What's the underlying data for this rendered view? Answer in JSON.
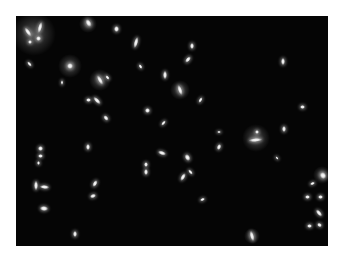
{
  "image": {
    "description": "Fluorescence micrograph of rod-shaped bacteria on a dark background",
    "frame": {
      "x": 16,
      "y": 16,
      "width": 312,
      "height": 230
    },
    "background_color": "#050505",
    "cell_color": "#ffffff",
    "glows": [
      {
        "x": 34,
        "y": 34,
        "r": 22
      },
      {
        "x": 70,
        "y": 66,
        "r": 12
      },
      {
        "x": 88,
        "y": 24,
        "r": 9
      },
      {
        "x": 100,
        "y": 80,
        "r": 11
      },
      {
        "x": 180,
        "y": 90,
        "r": 10
      },
      {
        "x": 256,
        "y": 138,
        "r": 14
      },
      {
        "x": 322,
        "y": 175,
        "r": 9
      },
      {
        "x": 252,
        "y": 236,
        "r": 8
      }
    ],
    "cells": [
      {
        "x": 28,
        "y": 32,
        "w": 3,
        "h": 9,
        "rot": -35
      },
      {
        "x": 40,
        "y": 27,
        "w": 3,
        "h": 10,
        "rot": 15
      },
      {
        "x": 38,
        "y": 38,
        "w": 4,
        "h": 4,
        "rot": 0
      },
      {
        "x": 30,
        "y": 42,
        "w": 3,
        "h": 3,
        "rot": 0
      },
      {
        "x": 88,
        "y": 23,
        "w": 4,
        "h": 7,
        "rot": -30
      },
      {
        "x": 116,
        "y": 29,
        "w": 4,
        "h": 5,
        "rot": 0
      },
      {
        "x": 136,
        "y": 42,
        "w": 3,
        "h": 10,
        "rot": 15
      },
      {
        "x": 29,
        "y": 64,
        "w": 2,
        "h": 5,
        "rot": -40
      },
      {
        "x": 70,
        "y": 66,
        "w": 5,
        "h": 5,
        "rot": 0
      },
      {
        "x": 62,
        "y": 82,
        "w": 1,
        "h": 4,
        "rot": 0
      },
      {
        "x": 100,
        "y": 80,
        "w": 3,
        "h": 9,
        "rot": -30
      },
      {
        "x": 107,
        "y": 77,
        "w": 2,
        "h": 4,
        "rot": -40
      },
      {
        "x": 88,
        "y": 100,
        "w": 4,
        "h": 3,
        "rot": 0
      },
      {
        "x": 97,
        "y": 100,
        "w": 3,
        "h": 8,
        "rot": -45
      },
      {
        "x": 140,
        "y": 66,
        "w": 2,
        "h": 4,
        "rot": -30
      },
      {
        "x": 165,
        "y": 75,
        "w": 3,
        "h": 7,
        "rot": 0
      },
      {
        "x": 192,
        "y": 46,
        "w": 3,
        "h": 5,
        "rot": 0
      },
      {
        "x": 188,
        "y": 59,
        "w": 3,
        "h": 6,
        "rot": 40
      },
      {
        "x": 180,
        "y": 90,
        "w": 3,
        "h": 9,
        "rot": -20
      },
      {
        "x": 200,
        "y": 100,
        "w": 2,
        "h": 5,
        "rot": 30
      },
      {
        "x": 147,
        "y": 110,
        "w": 4,
        "h": 4,
        "rot": 0
      },
      {
        "x": 106,
        "y": 118,
        "w": 3,
        "h": 5,
        "rot": -40
      },
      {
        "x": 163,
        "y": 123,
        "w": 2,
        "h": 5,
        "rot": 40
      },
      {
        "x": 283,
        "y": 61,
        "w": 3,
        "h": 6,
        "rot": 0
      },
      {
        "x": 302,
        "y": 107,
        "w": 4,
        "h": 3,
        "rot": 0
      },
      {
        "x": 284,
        "y": 129,
        "w": 3,
        "h": 5,
        "rot": 0
      },
      {
        "x": 219,
        "y": 132,
        "w": 3,
        "h": 1,
        "rot": 0
      },
      {
        "x": 257,
        "y": 132,
        "w": 3,
        "h": 3,
        "rot": 0
      },
      {
        "x": 255,
        "y": 140,
        "w": 12,
        "h": 3,
        "rot": -5
      },
      {
        "x": 219,
        "y": 147,
        "w": 3,
        "h": 5,
        "rot": 20
      },
      {
        "x": 277,
        "y": 158,
        "w": 1,
        "h": 3,
        "rot": -40
      },
      {
        "x": 40,
        "y": 148,
        "w": 4,
        "h": 4,
        "rot": 0
      },
      {
        "x": 40,
        "y": 156,
        "w": 4,
        "h": 3,
        "rot": 0
      },
      {
        "x": 38,
        "y": 163,
        "w": 2,
        "h": 3,
        "rot": 0
      },
      {
        "x": 88,
        "y": 147,
        "w": 3,
        "h": 5,
        "rot": 0
      },
      {
        "x": 162,
        "y": 153,
        "w": 7,
        "h": 3,
        "rot": 20
      },
      {
        "x": 187,
        "y": 157,
        "w": 4,
        "h": 6,
        "rot": -30
      },
      {
        "x": 146,
        "y": 164,
        "w": 3,
        "h": 4,
        "rot": 0
      },
      {
        "x": 146,
        "y": 172,
        "w": 3,
        "h": 5,
        "rot": 0
      },
      {
        "x": 183,
        "y": 177,
        "w": 3,
        "h": 7,
        "rot": 30
      },
      {
        "x": 190,
        "y": 172,
        "w": 2,
        "h": 5,
        "rot": -40
      },
      {
        "x": 36,
        "y": 185,
        "w": 3,
        "h": 8,
        "rot": 0
      },
      {
        "x": 44,
        "y": 187,
        "w": 8,
        "h": 3,
        "rot": 5
      },
      {
        "x": 95,
        "y": 183,
        "w": 3,
        "h": 6,
        "rot": 30
      },
      {
        "x": 93,
        "y": 196,
        "w": 5,
        "h": 3,
        "rot": -20
      },
      {
        "x": 44,
        "y": 208,
        "w": 7,
        "h": 4,
        "rot": 5
      },
      {
        "x": 202,
        "y": 199,
        "w": 4,
        "h": 2,
        "rot": -20
      },
      {
        "x": 75,
        "y": 234,
        "w": 3,
        "h": 5,
        "rot": 0
      },
      {
        "x": 252,
        "y": 236,
        "w": 3,
        "h": 9,
        "rot": -15
      },
      {
        "x": 323,
        "y": 175,
        "w": 5,
        "h": 6,
        "rot": -30
      },
      {
        "x": 312,
        "y": 183,
        "w": 4,
        "h": 2,
        "rot": -20
      },
      {
        "x": 307,
        "y": 197,
        "w": 4,
        "h": 3,
        "rot": 0
      },
      {
        "x": 320,
        "y": 197,
        "w": 4,
        "h": 3,
        "rot": 0
      },
      {
        "x": 319,
        "y": 213,
        "w": 3,
        "h": 7,
        "rot": -40
      },
      {
        "x": 309,
        "y": 226,
        "w": 4,
        "h": 3,
        "rot": 0
      },
      {
        "x": 319,
        "y": 225,
        "w": 4,
        "h": 3,
        "rot": 30
      }
    ]
  }
}
